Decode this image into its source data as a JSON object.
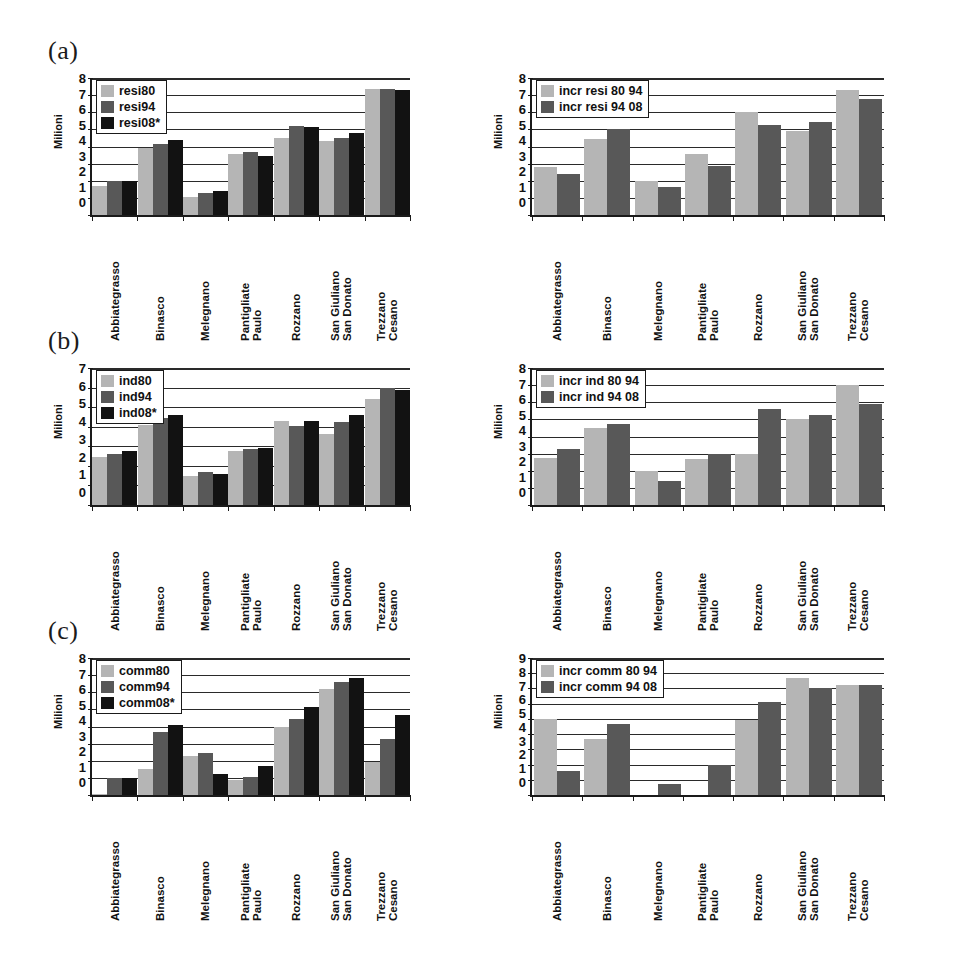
{
  "figure": {
    "panels": [
      {
        "tag": "(a)"
      },
      {
        "tag": "(b)"
      },
      {
        "tag": "(c)"
      }
    ]
  },
  "categories": [
    {
      "l1": "Abbiategrasso",
      "l2": ""
    },
    {
      "l1": "Binasco",
      "l2": ""
    },
    {
      "l1": "Melegnano",
      "l2": ""
    },
    {
      "l1": "Pantigliate",
      "l2": "Paulo"
    },
    {
      "l1": "Rozzano",
      "l2": ""
    },
    {
      "l1": "San Giuliano",
      "l2": "San Donato"
    },
    {
      "l1": "Trezzano",
      "l2": "Cesano"
    }
  ],
  "chart_data": [
    {
      "id": "a-left",
      "panel": "(a)",
      "position": "left",
      "type": "bar",
      "title": "",
      "xlabel": "",
      "ylabel": "Milioni",
      "ylim": [
        0,
        8
      ],
      "yticks": [
        8,
        7,
        6,
        5,
        4,
        3,
        2,
        1,
        0
      ],
      "grid": true,
      "legend_position": "top-left",
      "categories": [
        "Abbiategrasso",
        "Binasco",
        "Melegnano",
        "Pantigliate Paulo",
        "Rozzano",
        "San Giuliano San Donato",
        "Trezzano Cesano"
      ],
      "series": [
        {
          "name": "resi80",
          "color": "#b5b5b5",
          "values": [
            1.7,
            3.9,
            1.05,
            3.55,
            4.5,
            4.3,
            7.35
          ]
        },
        {
          "name": "resi94",
          "color": "#585858",
          "values": [
            2.0,
            4.15,
            1.3,
            3.7,
            5.2,
            4.5,
            7.35
          ]
        },
        {
          "name": "resi08*",
          "color": "#121212",
          "values": [
            2.0,
            4.4,
            1.4,
            3.45,
            5.15,
            4.8,
            7.3
          ]
        }
      ]
    },
    {
      "id": "a-right",
      "panel": "(a)",
      "position": "right",
      "type": "bar",
      "title": "",
      "xlabel": "",
      "ylabel": "Milioni",
      "ylim": [
        0,
        8
      ],
      "yticks": [
        8,
        7,
        6,
        5,
        4,
        3,
        2,
        1,
        0
      ],
      "grid": true,
      "legend_position": "top-left",
      "categories": [
        "Abbiategrasso",
        "Binasco",
        "Melegnano",
        "Pantigliate Paulo",
        "Rozzano",
        "San Giuliano San Donato",
        "Trezzano Cesano"
      ],
      "series": [
        {
          "name": "incr resi 80 94",
          "color": "#b5b5b5",
          "values": [
            2.8,
            4.45,
            2.0,
            3.55,
            6.0,
            4.9,
            7.3
          ]
        },
        {
          "name": "incr resi 94 08",
          "color": "#585858",
          "values": [
            2.4,
            5.05,
            1.65,
            2.85,
            5.25,
            5.45,
            6.75
          ]
        }
      ]
    },
    {
      "id": "b-left",
      "panel": "(b)",
      "position": "left",
      "type": "bar",
      "title": "",
      "xlabel": "",
      "ylabel": "Milioni",
      "ylim": [
        0,
        7
      ],
      "yticks": [
        7,
        6,
        5,
        4,
        3,
        2,
        1,
        0
      ],
      "grid": true,
      "legend_position": "top-left",
      "categories": [
        "Abbiategrasso",
        "Binasco",
        "Melegnano",
        "Pantigliate Paulo",
        "Rozzano",
        "San Giuliano San Donato",
        "Trezzano Cesano"
      ],
      "series": [
        {
          "name": "ind80",
          "color": "#b5b5b5",
          "values": [
            2.45,
            4.1,
            1.5,
            2.75,
            4.3,
            3.65,
            5.4
          ]
        },
        {
          "name": "ind94",
          "color": "#585858",
          "values": [
            2.6,
            4.45,
            1.7,
            2.85,
            4.05,
            4.25,
            6.0
          ]
        },
        {
          "name": "ind08*",
          "color": "#121212",
          "values": [
            2.75,
            4.6,
            1.6,
            2.9,
            4.3,
            4.6,
            5.9
          ]
        }
      ]
    },
    {
      "id": "b-right",
      "panel": "(b)",
      "position": "right",
      "type": "bar",
      "title": "",
      "xlabel": "",
      "ylabel": "Milioni",
      "ylim": [
        0,
        8
      ],
      "yticks": [
        8,
        7,
        6,
        5,
        4,
        3,
        2,
        1,
        0
      ],
      "grid": true,
      "legend_position": "top-left",
      "categories": [
        "Abbiategrasso",
        "Binasco",
        "Melegnano",
        "Pantigliate Paulo",
        "Rozzano",
        "San Giuliano San Donato",
        "Trezzano Cesano"
      ],
      "series": [
        {
          "name": "incr ind 80 94",
          "color": "#b5b5b5",
          "values": [
            2.75,
            4.5,
            2.0,
            2.7,
            3.0,
            5.0,
            7.0
          ]
        },
        {
          "name": "incr ind 94 08",
          "color": "#585858",
          "values": [
            3.3,
            4.75,
            1.4,
            3.0,
            5.6,
            5.25,
            5.9
          ]
        }
      ]
    },
    {
      "id": "c-left",
      "panel": "(c)",
      "position": "left",
      "type": "bar",
      "title": "",
      "xlabel": "",
      "ylabel": "Milioni",
      "ylim": [
        0,
        8
      ],
      "yticks": [
        8,
        7,
        6,
        5,
        4,
        3,
        2,
        1,
        0
      ],
      "grid": true,
      "legend_position": "top-left",
      "categories": [
        "Abbiategrasso",
        "Binasco",
        "Melegnano",
        "Pantigliate Paulo",
        "Rozzano",
        "San Giuliano San Donato",
        "Trezzano Cesano"
      ],
      "series": [
        {
          "name": "comm80",
          "color": "#b5b5b5",
          "values": [
            0.05,
            1.5,
            2.3,
            0.9,
            4.0,
            6.2,
            1.95
          ]
        },
        {
          "name": "comm94",
          "color": "#585858",
          "values": [
            1.0,
            3.7,
            2.45,
            1.05,
            4.45,
            6.6,
            3.25
          ]
        },
        {
          "name": "comm08*",
          "color": "#121212",
          "values": [
            1.0,
            4.1,
            1.2,
            1.7,
            5.15,
            6.85,
            4.7
          ]
        }
      ]
    },
    {
      "id": "c-right",
      "panel": "(c)",
      "position": "right",
      "type": "bar",
      "title": "",
      "xlabel": "",
      "ylabel": "Milioni",
      "ylim": [
        0,
        9
      ],
      "yticks": [
        9,
        8,
        7,
        6,
        5,
        4,
        3,
        2,
        1,
        0
      ],
      "grid": true,
      "legend_position": "top-left",
      "categories": [
        "Abbiategrasso",
        "Binasco",
        "Melegnano",
        "Pantigliate Paulo",
        "Rozzano",
        "San Giuliano San Donato",
        "Trezzano Cesano"
      ],
      "series": [
        {
          "name": "incr comm 80 94",
          "color": "#b5b5b5",
          "values": [
            5.0,
            3.7,
            0.0,
            0.0,
            4.9,
            7.7,
            7.2
          ]
        },
        {
          "name": "incr comm 94 08",
          "color": "#585858",
          "values": [
            1.55,
            4.65,
            0.7,
            2.0,
            6.1,
            7.05,
            7.2
          ]
        }
      ]
    }
  ]
}
